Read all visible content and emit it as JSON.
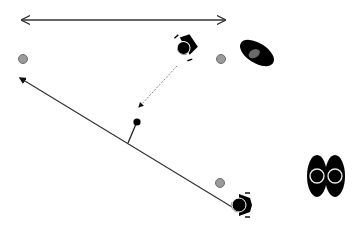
{
  "diagram": {
    "background": "#ffffff",
    "colors": {
      "line": "#333333",
      "pass_line": "#666666",
      "cone": "#9a9a9a",
      "cone_edge": "#6e6e6e",
      "player": "#000000",
      "ball": "#000000",
      "mannequin": "#000000",
      "mannequin_inner": "#6a6a6a",
      "ring": "#e6e6e6"
    },
    "elements": {
      "width_arrow": {
        "label": "width-arrow",
        "x1": 22,
        "y1": 20,
        "x2": 225,
        "y2": 20,
        "double_headed": true
      },
      "cones": [
        {
          "label": "cone-left",
          "x": 23,
          "y": 59
        },
        {
          "label": "cone-top-right",
          "x": 221,
          "y": 59
        },
        {
          "label": "cone-bottom-right",
          "x": 220,
          "y": 183
        }
      ],
      "players": [
        {
          "label": "player-top",
          "x": 187,
          "y": 46,
          "rotation": -30
        },
        {
          "label": "player-bottom",
          "x": 240,
          "y": 205,
          "rotation": 0
        }
      ],
      "pass_arrow": {
        "label": "pass-arrow",
        "x1": 177,
        "y1": 66,
        "x2": 138,
        "y2": 108,
        "dashed": true
      },
      "ball": {
        "label": "ball",
        "x": 137,
        "y": 122,
        "r": 3.5
      },
      "ball_stem": {
        "x1": 136,
        "y1": 124,
        "x2": 128,
        "y2": 143
      },
      "run_arrow": {
        "label": "run-arrow",
        "x1": 232,
        "y1": 207,
        "x2": 20,
        "y2": 78
      },
      "mannequin_single": {
        "label": "mannequin-single",
        "x": 257,
        "y": 53,
        "rx": 19,
        "ry": 10,
        "rotation": 30
      },
      "mannequin_pair": [
        {
          "label": "mannequin-pair-left",
          "x": 317,
          "y": 176,
          "rx": 10,
          "ry": 21
        },
        {
          "label": "mannequin-pair-right",
          "x": 335,
          "y": 176,
          "rx": 10,
          "ry": 21
        }
      ]
    }
  }
}
